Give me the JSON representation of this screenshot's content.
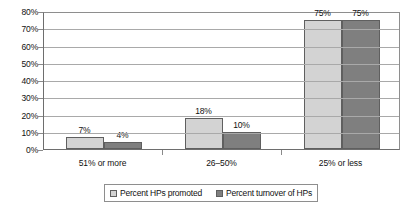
{
  "chart_data": {
    "type": "bar",
    "title": "",
    "xlabel": "",
    "ylabel": "",
    "ylim": [
      0,
      80
    ],
    "grid": true,
    "legend_position": "bottom",
    "categories": [
      "51% or more",
      "26–50%",
      "25% or less"
    ],
    "y_ticks": [
      "0%",
      "10%",
      "20%",
      "30%",
      "40%",
      "50%",
      "60%",
      "70%",
      "80%"
    ],
    "y_tick_values": [
      0,
      10,
      20,
      30,
      40,
      50,
      60,
      70,
      80
    ],
    "series": [
      {
        "name": "Percent HPs promoted",
        "color": "#d3d3d3",
        "values": [
          7,
          18,
          75
        ],
        "labels": [
          "7%",
          "18%",
          "75%"
        ]
      },
      {
        "name": "Percent turnover of HPs",
        "color": "#7f7f7f",
        "values": [
          4,
          10,
          75
        ],
        "labels": [
          "4%",
          "10%",
          "75%"
        ]
      }
    ]
  },
  "legend": {
    "items": [
      {
        "label": "Percent HPs promoted",
        "color": "#d3d3d3"
      },
      {
        "label": "Percent turnover of HPs",
        "color": "#7f7f7f"
      }
    ]
  }
}
